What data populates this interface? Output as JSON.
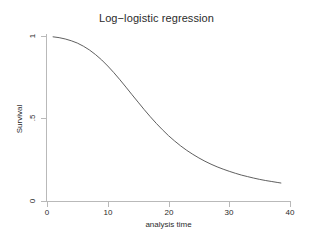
{
  "chart_data": {
    "type": "line",
    "title": "Log−logistic regression",
    "xlabel": "analysis time",
    "ylabel": "Survival",
    "xlim": [
      0,
      40
    ],
    "ylim": [
      0,
      1
    ],
    "grid": false,
    "legend": null,
    "xticks": [
      0,
      10,
      20,
      30,
      40
    ],
    "xtick_labels": [
      "0",
      "10",
      "20",
      "30",
      "40"
    ],
    "yticks": [
      0,
      0.5,
      1
    ],
    "ytick_labels": [
      "0",
      ".5",
      "1"
    ],
    "series": [
      {
        "name": "Survival",
        "color": "#4d4d4d",
        "x": [
          1,
          2,
          3,
          4,
          5,
          6,
          7,
          8,
          9,
          10,
          11,
          12,
          13,
          14,
          15,
          16,
          17,
          18,
          19,
          20,
          21,
          22,
          23,
          24,
          25,
          26,
          27,
          28,
          29,
          30,
          31,
          32,
          33,
          34,
          35,
          36,
          37,
          38,
          38.5
        ],
        "y": [
          0.995,
          0.99,
          0.982,
          0.971,
          0.957,
          0.938,
          0.915,
          0.887,
          0.855,
          0.818,
          0.778,
          0.735,
          0.69,
          0.644,
          0.599,
          0.554,
          0.511,
          0.47,
          0.432,
          0.396,
          0.364,
          0.334,
          0.307,
          0.283,
          0.261,
          0.241,
          0.223,
          0.207,
          0.193,
          0.18,
          0.168,
          0.157,
          0.148,
          0.139,
          0.131,
          0.124,
          0.118,
          0.112,
          0.109
        ]
      }
    ]
  },
  "axes": {
    "title": "Log−logistic regression",
    "x_title": "analysis time",
    "y_title": "Survival",
    "x_tick_labels": [
      "0",
      "10",
      "20",
      "30",
      "40"
    ],
    "y_tick_labels": [
      "1",
      ".5",
      "0"
    ]
  },
  "colors": {
    "curve": "#4d4d4d",
    "axis": "#b9b9b9",
    "text": "#2b2b2b",
    "background": "#ffffff"
  }
}
